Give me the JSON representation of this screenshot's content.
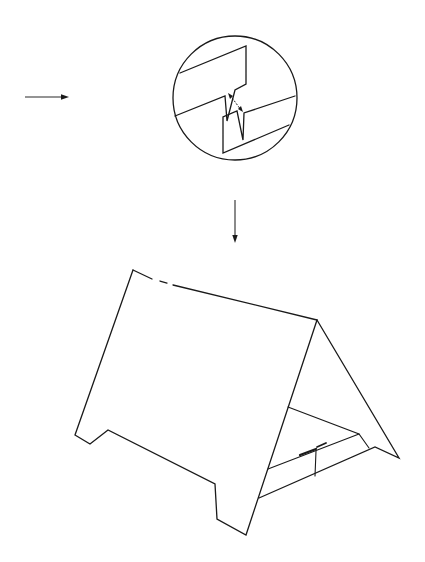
{
  "figure": {
    "type": "instructional-assembly-diagram",
    "background": "#ffffff",
    "line_color": "#1a1a1a",
    "elements": {
      "left_arrow": {
        "direction": "right",
        "from": [
          25,
          97
        ],
        "to": [
          68,
          97
        ]
      },
      "detail_inset": {
        "shape": "circle",
        "center": [
          235,
          98
        ],
        "radius": 62,
        "content": "interlocking slot tabs with insertion arrow"
      },
      "down_arrow": {
        "direction": "down",
        "from": [
          235,
          200
        ],
        "to": [
          235,
          242
        ]
      },
      "tent_stand": {
        "content": "assembled A-frame display stand with front panel, rear panel and interlocking base tabs"
      }
    }
  }
}
